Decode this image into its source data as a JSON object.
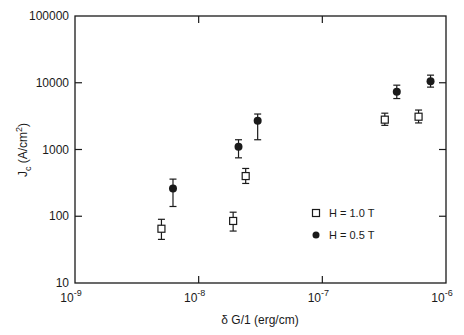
{
  "chart_data": {
    "type": "scatter",
    "title": "",
    "xlabel": "δ G/1 (erg/cm)",
    "ylabel": "J_c (A/cm^2)",
    "xscale": "log",
    "yscale": "log",
    "xlim": [
      1e-09,
      1e-06
    ],
    "ylim": [
      10,
      100000
    ],
    "grid": false,
    "x_ticks": [
      {
        "value": 1e-09,
        "base": "10",
        "exp": "-9"
      },
      {
        "value": 1e-08,
        "base": "10",
        "exp": "-8"
      },
      {
        "value": 1e-07,
        "base": "10",
        "exp": "-7"
      },
      {
        "value": 1e-06,
        "base": "10",
        "exp": "-6"
      }
    ],
    "y_ticks": [
      {
        "value": 10,
        "label": "10"
      },
      {
        "value": 100,
        "label": "100"
      },
      {
        "value": 1000,
        "label": "1000"
      },
      {
        "value": 10000,
        "label": "10000"
      },
      {
        "value": 100000,
        "label": "100000"
      }
    ],
    "legend_position": "lower right (inside plot)",
    "series": [
      {
        "name": "H = 1.0 T",
        "marker": "open-square",
        "points": [
          {
            "x": 5e-09,
            "y": 65,
            "ylo": 45,
            "yhi": 90
          },
          {
            "x": 1.9e-08,
            "y": 85,
            "ylo": 60,
            "yhi": 115
          },
          {
            "x": 2.4e-08,
            "y": 400,
            "ylo": 310,
            "yhi": 520
          },
          {
            "x": 3.2e-07,
            "y": 2800,
            "ylo": 2300,
            "yhi": 3500
          },
          {
            "x": 6e-07,
            "y": 3100,
            "ylo": 2500,
            "yhi": 3900
          }
        ]
      },
      {
        "name": "H = 0.5 T",
        "marker": "filled-circle",
        "points": [
          {
            "x": 6.2e-09,
            "y": 260,
            "ylo": 140,
            "yhi": 360
          },
          {
            "x": 2.1e-08,
            "y": 1100,
            "ylo": 750,
            "yhi": 1400
          },
          {
            "x": 3e-08,
            "y": 2700,
            "ylo": 1400,
            "yhi": 3400
          },
          {
            "x": 4e-07,
            "y": 7300,
            "ylo": 5800,
            "yhi": 9200
          },
          {
            "x": 7.5e-07,
            "y": 10500,
            "ylo": 8600,
            "yhi": 13000
          }
        ]
      }
    ]
  },
  "legend": {
    "items": [
      {
        "label": "H = 1.0 T",
        "marker": "open-square"
      },
      {
        "label": "H = 0.5 T",
        "marker": "filled-circle"
      }
    ]
  },
  "axes": {
    "x_title": "δ G/1 (erg/cm)",
    "y_title_main": "J",
    "y_title_sub": "c",
    "y_title_rest": " (A/cm",
    "y_title_sup": "2",
    "y_title_close": ")"
  },
  "colors": {
    "ink": "#1a1a1a",
    "background": "#ffffff"
  }
}
